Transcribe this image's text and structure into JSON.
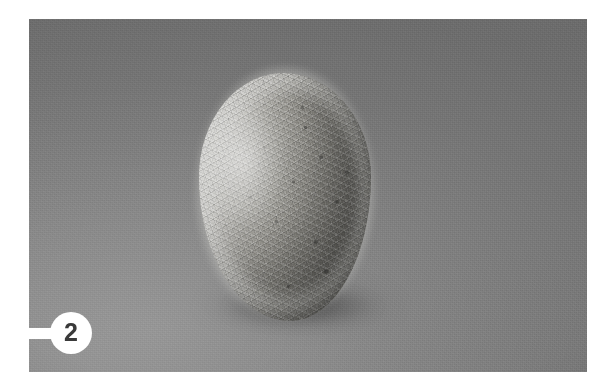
{
  "figure": {
    "label_number": "2",
    "callout_icon": "leader-line-icon",
    "caption": "",
    "plate": {
      "kind": "photograph",
      "color_mode": "grayscale",
      "background_color": "#b4b4b4",
      "background_description": "plain seamless studio sweep, lighter toward lower left",
      "border_color": "#ffffff"
    },
    "subject": {
      "name": "woolly fibrous cocoon specimen",
      "description": "rounded ovoid mass of tangled pale fibers, lit from the left with a darker right flank and a soft cast shadow beneath",
      "surface_color_light": "#e3e3e1",
      "surface_color_mid": "#c6c5c1",
      "surface_color_dark": "#949390",
      "shadow_color": "#4a4a4a"
    }
  },
  "colors": {
    "page": "#ffffff",
    "plate_background": "#b4b4b4",
    "callout_disc": "#ffffff",
    "callout_text": "#3a3a3a"
  }
}
